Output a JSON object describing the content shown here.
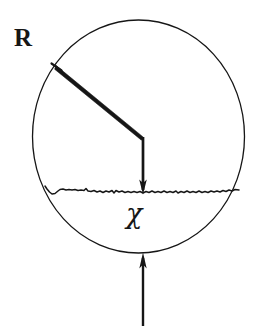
{
  "figure": {
    "background_color": "#ffffff",
    "ink_color": "#161616",
    "labels": {
      "radius_label": "R",
      "angle_label": "χ"
    },
    "icons": {
      "circle": "circle-boundary-icon",
      "incident_ray": "incident-ray-icon",
      "normal_ray": "normal-ray-arrow-icon",
      "rough_surface": "rough-surface-line-icon",
      "bottom_arrow": "upward-arrow-icon"
    },
    "geometry": {
      "circle": {
        "cx": 138.5,
        "cy": 136.5,
        "rx": 106.0,
        "ry": 116.5,
        "stroke_width": 1.3
      },
      "incident_ray": {
        "x1": 57,
        "y1": 67,
        "x2": 143,
        "y2": 138,
        "stroke_width": 3.4
      },
      "normal_ray": {
        "x1": 143,
        "y1": 138,
        "x2": 143,
        "y2": 193,
        "stroke_width": 2.6
      },
      "normal_arrowhead": {
        "tip_x": 143,
        "tip_y": 193,
        "half_width": 3.6,
        "length": 13
      },
      "surface_line": {
        "x_start": 45,
        "x_end": 239,
        "y": 193,
        "stroke_width": 1.5
      },
      "bottom_arrow": {
        "x": 143,
        "y_bottom": 326,
        "y_tip": 254,
        "stroke_width": 2.4,
        "half_width": 3.6,
        "head_length": 14
      }
    }
  }
}
